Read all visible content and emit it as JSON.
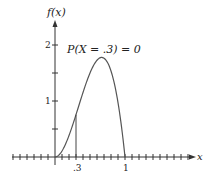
{
  "chart_data": {
    "type": "line",
    "title": "",
    "annotation": "P(X = .3) = 0",
    "xlabel": "x",
    "ylabel": "f(x)",
    "function": "f(x) = 12x^2(1 - x), 0 <= x <= 1",
    "xlim": [
      -0.8,
      1.95
    ],
    "ylim": [
      0,
      2.2
    ],
    "x_tick_step": 0.1,
    "x_tick_labels": [
      {
        "value": 0.3,
        "label": ".3"
      },
      {
        "value": 1,
        "label": "1"
      }
    ],
    "y_tick_step": 0.5,
    "y_tick_labels": [
      {
        "value": 1,
        "label": "1"
      },
      {
        "value": 2,
        "label": "2"
      }
    ],
    "marker_line": {
      "x": 0.3,
      "y": 0.756
    },
    "series": [
      {
        "name": "f(x)",
        "x": [
          0,
          0.1,
          0.2,
          0.3,
          0.4,
          0.5,
          0.6,
          0.667,
          0.7,
          0.8,
          0.9,
          1.0
        ],
        "y": [
          0,
          0.108,
          0.384,
          0.756,
          1.152,
          1.5,
          1.728,
          1.778,
          1.764,
          1.536,
          0.972,
          0
        ]
      }
    ],
    "grid": false,
    "legend": "none"
  },
  "labels": {
    "y_axis": "f(x)",
    "x_axis": "x",
    "annotation": "P(X = .3) = 0",
    "tick_03": ".3",
    "tick_1": "1",
    "ytick_1": "1",
    "ytick_2": "2"
  },
  "colors": {
    "axis": "#333333",
    "curve": "#555555",
    "text": "#222222"
  }
}
